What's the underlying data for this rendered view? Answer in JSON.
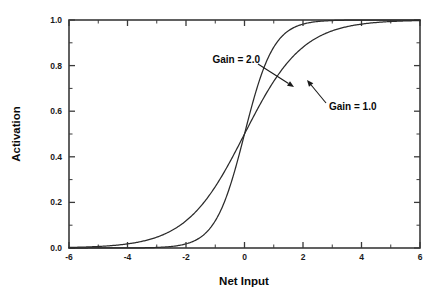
{
  "chart_data": {
    "type": "line",
    "title": "",
    "xlabel": "Net Input",
    "ylabel": "Activation",
    "xlim": [
      -6,
      6
    ],
    "ylim": [
      0.0,
      1.0
    ],
    "grid": false,
    "legend_position": "inline-annotations",
    "x_ticks": [
      -6,
      -4,
      -2,
      0,
      2,
      4,
      6
    ],
    "x_tick_labels": [
      "-6",
      "-4",
      "-2",
      "0",
      "2",
      "4",
      "6"
    ],
    "x_minor_tick_step": 1,
    "y_ticks": [
      0.0,
      0.2,
      0.4,
      0.6,
      0.8,
      1.0
    ],
    "y_tick_labels": [
      "0.0",
      "0.2",
      "0.4",
      "0.6",
      "0.8",
      "1.0"
    ],
    "y_minor_tick_step": 0.1,
    "series": [
      {
        "name": "Gain = 1.0",
        "gain": 1.0,
        "x": [
          -6,
          -5.5,
          -5,
          -4.5,
          -4,
          -3.5,
          -3,
          -2.5,
          -2,
          -1.5,
          -1,
          -0.5,
          0,
          0.5,
          1,
          1.5,
          2,
          2.5,
          3,
          3.5,
          4,
          4.5,
          5,
          5.5,
          6
        ],
        "values": [
          0.002,
          0.004,
          0.007,
          0.011,
          0.018,
          0.029,
          0.047,
          0.076,
          0.119,
          0.182,
          0.269,
          0.378,
          0.5,
          0.622,
          0.731,
          0.818,
          0.881,
          0.924,
          0.953,
          0.971,
          0.982,
          0.989,
          0.993,
          0.996,
          0.998
        ]
      },
      {
        "name": "Gain = 2.0",
        "gain": 2.0,
        "x": [
          -6,
          -5.5,
          -5,
          -4.5,
          -4,
          -3.5,
          -3,
          -2.5,
          -2,
          -1.5,
          -1,
          -0.5,
          0,
          0.5,
          1,
          1.5,
          2,
          2.5,
          3,
          3.5,
          4,
          4.5,
          5,
          5.5,
          6
        ],
        "values": [
          6e-06,
          1.7e-05,
          4.5e-05,
          0.00012,
          0.000335,
          0.000911,
          0.002473,
          0.006693,
          0.017986,
          0.047426,
          0.119203,
          0.268941,
          0.5,
          0.731059,
          0.880797,
          0.952574,
          0.982014,
          0.993307,
          0.997527,
          0.999089,
          0.999665,
          0.999877,
          0.999955,
          0.999983,
          0.999994
        ]
      }
    ],
    "annotations": [
      {
        "label": "Gain = 2.0",
        "label_x": 195,
        "label_y": 63,
        "arrow_from_x": 258,
        "arrow_from_y": 64,
        "arrow_to_x": 294,
        "arrow_to_y": 87
      },
      {
        "label": "Gain = 1.0",
        "label_x": 329,
        "label_y": 110,
        "arrow_from_x": 326,
        "arrow_from_y": 103,
        "arrow_to_x": 307,
        "arrow_to_y": 80
      }
    ],
    "colors": {
      "background": "#ffffff",
      "axis": "#3a3a3a",
      "curve": "#2b2b2b",
      "text": "#0a0a0a"
    }
  }
}
